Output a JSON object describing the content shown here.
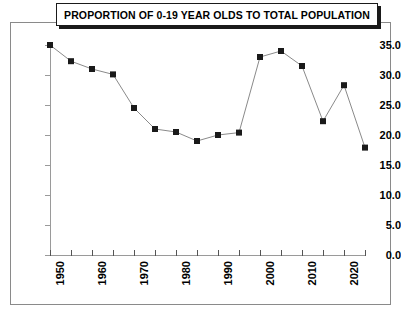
{
  "title": "PROPORTION OF 0-19 YEAR OLDS TO TOTAL POPULATION",
  "axes": {
    "y_ticks": [
      "0.0",
      "5.0",
      "10.0",
      "15.0",
      "20.0",
      "25.0",
      "30.0",
      "35.0"
    ],
    "x_ticks": [
      "1950",
      "1960",
      "1970",
      "1980",
      "1990",
      "2000",
      "2010",
      "2020"
    ]
  },
  "colors": {
    "marker": "#1a1a1a",
    "line": "#8a8a8a",
    "axis": "#9a9a9a",
    "frame": "#8a8a8a",
    "title_border": "#1a1a1a",
    "background": "#ffffff"
  },
  "chart_data": {
    "type": "line",
    "title": "PROPORTION OF 0-19 YEAR OLDS TO TOTAL POPULATION",
    "xlabel": "",
    "ylabel": "",
    "xlim": [
      1950,
      2025
    ],
    "ylim": [
      0.0,
      35.0
    ],
    "ytick_step": 5.0,
    "xtick_step": 5,
    "xtick_labeled_step": 10,
    "grid": false,
    "legend": false,
    "marker": "square",
    "x": [
      1950,
      1955,
      1960,
      1965,
      1970,
      1975,
      1980,
      1985,
      1990,
      1995,
      2000,
      2005,
      2010,
      2015,
      2020,
      2025
    ],
    "values": [
      35.0,
      32.3,
      31.0,
      30.1,
      24.5,
      21.0,
      20.5,
      19.0,
      20.0,
      20.4,
      33.0,
      34.0,
      31.5,
      22.3,
      28.3,
      17.9
    ],
    "xtick_labels": [
      "1950",
      "",
      "1960",
      "",
      "1970",
      "",
      "1980",
      "",
      "1990",
      "",
      "2000",
      "",
      "2010",
      "",
      "2020",
      ""
    ]
  }
}
